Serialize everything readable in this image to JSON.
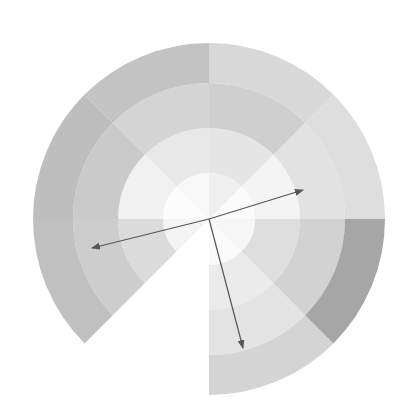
{
  "figure": {
    "name": "polar-sunburst-vector-plot",
    "background_color": "#ffffff",
    "width": 408,
    "height": 420
  },
  "chart_data": {
    "type": "pie",
    "title": "",
    "subtitle": "",
    "xlabel": "",
    "ylabel": "",
    "grid": false,
    "legend_position": "none",
    "projection": "polar",
    "center": {
      "x": 209,
      "y": 219
    },
    "outer_radius": 176,
    "ring_count": 4,
    "sector_count": 8,
    "ring_radii": [
      46,
      91,
      136,
      176
    ],
    "ring_labels": [
      "ring-1",
      "ring-2",
      "ring-3",
      "ring-4"
    ],
    "sector_start_angles_deg": [
      0,
      45,
      90,
      135,
      180,
      225,
      270,
      315
    ],
    "sector_labels": [
      "S1",
      "S2",
      "S3",
      "S4",
      "S5",
      "S6",
      "S7",
      "S8"
    ],
    "colorscale": "grayscale",
    "categories": [
      "S1",
      "S2",
      "S3",
      "S4",
      "S5",
      "S6",
      "S7",
      "S8"
    ],
    "values": [
      1,
      1,
      1,
      1,
      1,
      1,
      1,
      1
    ],
    "cells": [
      {
        "sector": "S1",
        "ring": 1,
        "value": 0.06,
        "color": "#fbfbfb"
      },
      {
        "sector": "S1",
        "ring": 2,
        "value": 0.1,
        "color": "#f4f4f4"
      },
      {
        "sector": "S1",
        "ring": 3,
        "value": 0.22,
        "color": "#e2e2e2"
      },
      {
        "sector": "S1",
        "ring": 4,
        "value": 0.24,
        "color": "#dedede"
      },
      {
        "sector": "S2",
        "ring": 1,
        "value": 0.14,
        "color": "#efefef"
      },
      {
        "sector": "S2",
        "ring": 2,
        "value": 0.2,
        "color": "#e5e5e5"
      },
      {
        "sector": "S2",
        "ring": 3,
        "value": 0.33,
        "color": "#cfcfcf"
      },
      {
        "sector": "S2",
        "ring": 4,
        "value": 0.28,
        "color": "#d8d8d8"
      },
      {
        "sector": "S3",
        "ring": 1,
        "value": 0.08,
        "color": "#f8f8f8"
      },
      {
        "sector": "S3",
        "ring": 2,
        "value": 0.18,
        "color": "#e8e8e8"
      },
      {
        "sector": "S3",
        "ring": 3,
        "value": 0.3,
        "color": "#d4d4d4"
      },
      {
        "sector": "S3",
        "ring": 4,
        "value": 0.4,
        "color": "#c3c3c3"
      },
      {
        "sector": "S4",
        "ring": 1,
        "value": 0.04,
        "color": "#fcfcfc"
      },
      {
        "sector": "S4",
        "ring": 2,
        "value": 0.12,
        "color": "#f1f1f1"
      },
      {
        "sector": "S4",
        "ring": 3,
        "value": 0.36,
        "color": "#cacaca"
      },
      {
        "sector": "S4",
        "ring": 4,
        "value": 0.44,
        "color": "#bebebe"
      },
      {
        "sector": "S5",
        "ring": 1,
        "value": 0.1,
        "color": "#f4f4f4"
      },
      {
        "sector": "S5",
        "ring": 2,
        "value": 0.26,
        "color": "#dbdbdb"
      },
      {
        "sector": "S5",
        "ring": 3,
        "value": 0.34,
        "color": "#cdcdcd"
      },
      {
        "sector": "S5",
        "ring": 4,
        "value": 0.42,
        "color": "#c0c0c0"
      },
      {
        "sector": "S6",
        "ring": 1,
        "value": 0.0,
        "color": "#ffffff"
      },
      {
        "sector": "S6",
        "ring": 2,
        "value": 0.0,
        "color": "#ffffff"
      },
      {
        "sector": "S6",
        "ring": 3,
        "value": 0.0,
        "color": "#ffffff"
      },
      {
        "sector": "S6",
        "ring": 4,
        "value": 0.0,
        "color": "#ffffff"
      },
      {
        "sector": "S7",
        "ring": 1,
        "value": 0.05,
        "color": "#fafafa"
      },
      {
        "sector": "S7",
        "ring": 2,
        "value": 0.16,
        "color": "#ebebeb"
      },
      {
        "sector": "S7",
        "ring": 3,
        "value": 0.21,
        "color": "#e3e3e3"
      },
      {
        "sector": "S7",
        "ring": 4,
        "value": 0.3,
        "color": "#d4d4d4"
      },
      {
        "sector": "S8",
        "ring": 1,
        "value": 0.09,
        "color": "#f6f6f6"
      },
      {
        "sector": "S8",
        "ring": 2,
        "value": 0.24,
        "color": "#dedede"
      },
      {
        "sector": "S8",
        "ring": 3,
        "value": 0.31,
        "color": "#d2d2d2"
      },
      {
        "sector": "S8",
        "ring": 4,
        "value": 0.56,
        "color": "#a6a6a6"
      }
    ],
    "annotations": [
      {
        "name": "vector-arrow-1",
        "label": "",
        "from": {
          "x": 209,
          "y": 219
        },
        "to": {
          "x": 92,
          "y": 248
        },
        "angle_deg": 194,
        "length": 120,
        "color": "#555555"
      },
      {
        "name": "vector-arrow-2",
        "label": "",
        "from": {
          "x": 209,
          "y": 219
        },
        "to": {
          "x": 303,
          "y": 190
        },
        "angle_deg": 17,
        "length": 98,
        "color": "#555555"
      },
      {
        "name": "vector-arrow-3",
        "label": "",
        "from": {
          "x": 209,
          "y": 219
        },
        "to": {
          "x": 243,
          "y": 348
        },
        "angle_deg": 285,
        "length": 133,
        "color": "#555555"
      }
    ]
  }
}
